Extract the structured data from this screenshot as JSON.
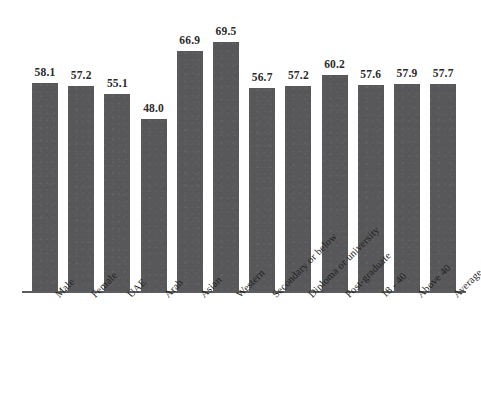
{
  "chart_data": {
    "type": "bar",
    "title": "",
    "subtitle": "",
    "xlabel": "",
    "ylabel": "",
    "ylim": [
      0,
      80
    ],
    "grid": false,
    "legend": "none",
    "bar_color": "#58585a",
    "categories": [
      "Male",
      "Female",
      "UAE",
      "Arab",
      "Asian",
      "Western",
      "Secondary or below",
      "Diploma or university",
      "Post-graduate",
      "18 - 40",
      "Above 40",
      "Average"
    ],
    "values": [
      58.1,
      57.2,
      55.1,
      48.0,
      66.9,
      69.5,
      56.7,
      57.2,
      60.2,
      57.6,
      57.9,
      57.7
    ],
    "value_labels": [
      "58.1",
      "57.2",
      "55.1",
      "48.0",
      "66.9",
      "69.5",
      "56.7",
      "57.2",
      "60.2",
      "57.6",
      "57.9",
      "57.7"
    ]
  }
}
